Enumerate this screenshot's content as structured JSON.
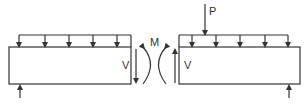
{
  "diagram": {
    "colors": {
      "line": "#333333",
      "background": "#ffffff"
    },
    "left_segment": {
      "shear_label": "V",
      "load_arrow_x": [
        19,
        45,
        69,
        93,
        117
      ]
    },
    "right_segment": {
      "shear_label": "V",
      "point_load_label": "P",
      "load_arrow_x": [
        192,
        216,
        240,
        265,
        288
      ]
    },
    "moment_label": "M"
  }
}
